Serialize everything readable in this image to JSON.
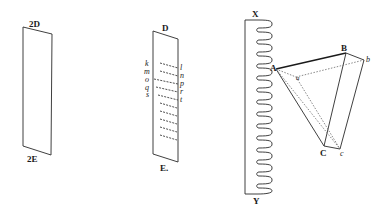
{
  "figure": {
    "panel_1": {
      "top_label": "2D",
      "bottom_label": "2E"
    },
    "panel_2": {
      "top_label": "D",
      "bottom_label": "E.",
      "left_labels": [
        "k",
        "m",
        "o",
        "q",
        "s"
      ],
      "right_labels": [
        "l",
        "n",
        "p",
        "r",
        "t"
      ],
      "dashed_line_count": 10
    },
    "panel_3": {
      "coil_top_label": "X",
      "coil_bottom_label": "Y",
      "coil_loop_count": 21,
      "vertex_labels": {
        "A": "A",
        "a": "a",
        "B": "B",
        "b": "b",
        "C": "C",
        "c": "c"
      }
    },
    "colors": {
      "background": "#ffffff",
      "ink": "#1a1a1a",
      "dotted": "#6a6a6a"
    }
  }
}
